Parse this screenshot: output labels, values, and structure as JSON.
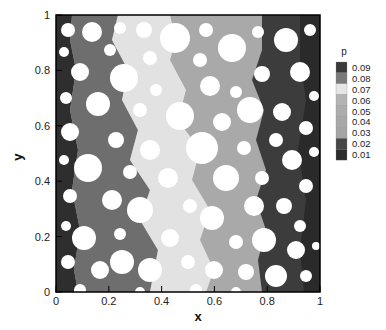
{
  "chart_data": {
    "type": "heatmap",
    "title": "",
    "xlabel": "x",
    "ylabel": "y",
    "xlim": [
      0,
      1
    ],
    "ylim": [
      0,
      1
    ],
    "x_ticks": [
      "0",
      "0.2",
      "0.4",
      "0.6",
      "0.8",
      "1"
    ],
    "y_ticks": [
      "0",
      "0.2",
      "0.4",
      "0.6",
      "0.8",
      "1"
    ],
    "grid": false,
    "colorbar": {
      "title": "p",
      "position": "right",
      "levels": [
        "0.09",
        "0.08",
        "0.07",
        "0.06",
        "0.05",
        "0.04",
        "0.03",
        "0.02",
        "0.01"
      ],
      "colors": [
        "#3a3a3a",
        "#7a7a7a",
        "#e6e6e6",
        "#b4b4b4",
        "#acacac",
        "#a8a8a8",
        "#a4a4a4",
        "#474747",
        "#2c2c2c"
      ]
    },
    "bands": [
      {
        "x_range": [
          0.0,
          0.1
        ],
        "level": "0.01",
        "color": "#2e2e2e"
      },
      {
        "x_range": [
          0.1,
          0.3
        ],
        "level": "0.02-0.03",
        "color": "#6e6e6e"
      },
      {
        "x_range": [
          0.2,
          0.5
        ],
        "level": "0.04-0.05",
        "color": "#e0e0e0"
      },
      {
        "x_range": [
          0.4,
          0.78
        ],
        "level": "0.06-0.07",
        "color": "#a9a9a9"
      },
      {
        "x_range": [
          0.78,
          0.95
        ],
        "level": "0.08",
        "color": "#3c3c3c"
      },
      {
        "x_range": [
          0.95,
          1.0
        ],
        "level": "0.09",
        "color": "#2a2a2a"
      }
    ]
  },
  "axes": {
    "x_label": "x",
    "y_label": "y"
  }
}
